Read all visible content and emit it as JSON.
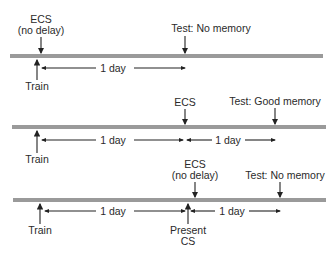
{
  "diagram": {
    "type": "timeline-comparison",
    "units": "days",
    "timelines": [
      {
        "id": "experiment-1",
        "events": [
          {
            "label": "Train",
            "position": "below",
            "direction": "up"
          },
          {
            "label_line1": "ECS",
            "label_line2": "(no delay)",
            "position": "above",
            "direction": "down"
          },
          {
            "label": "Test: No memory",
            "position": "above",
            "direction": "down"
          }
        ],
        "intervals": [
          {
            "label": "1 day",
            "from": "Train",
            "to": "Test"
          }
        ]
      },
      {
        "id": "experiment-2",
        "events": [
          {
            "label": "Train",
            "position": "below",
            "direction": "up"
          },
          {
            "label": "ECS",
            "position": "above",
            "direction": "down"
          },
          {
            "label": "Test: Good memory",
            "position": "above",
            "direction": "down"
          }
        ],
        "intervals": [
          {
            "label": "1 day",
            "from": "Train",
            "to": "ECS"
          },
          {
            "label": "1 day",
            "from": "ECS",
            "to": "Test"
          }
        ]
      },
      {
        "id": "experiment-3",
        "events": [
          {
            "label": "Train",
            "position": "below",
            "direction": "up"
          },
          {
            "label_line1": "ECS",
            "label_line2": "(no delay)",
            "position": "above",
            "direction": "down"
          },
          {
            "label_line1": "Present",
            "label_line2": "CS",
            "position": "below",
            "direction": "up"
          },
          {
            "label": "Test: No memory",
            "position": "above",
            "direction": "down"
          }
        ],
        "intervals": [
          {
            "label": "1 day",
            "from": "Train",
            "to": "Present CS"
          },
          {
            "label": "1 day",
            "from": "Present CS",
            "to": "Test"
          }
        ]
      }
    ],
    "colors": {
      "bar": "#9a9a9a",
      "arrow": "#222222",
      "text": "#2a2a2a"
    }
  }
}
